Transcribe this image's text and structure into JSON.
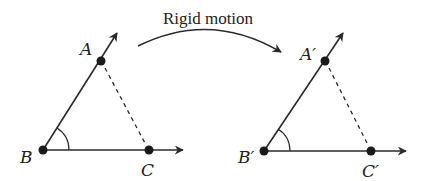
{
  "caption": "Rigid motion",
  "colors": {
    "stroke": "#2a2a2a",
    "point": "#1a1a1a",
    "background": "#ffffff"
  },
  "figures": [
    {
      "name": "original",
      "labels": {
        "A": "A",
        "B": "B",
        "C": "C"
      },
      "points": {
        "A": [
          101,
          61
        ],
        "B": [
          43,
          150
        ],
        "C": [
          149,
          150
        ]
      },
      "segment_AC": "dashed",
      "angle_marked": "ABC"
    },
    {
      "name": "image",
      "labels": {
        "A": "A′",
        "B": "B′",
        "C": "C′"
      },
      "points": {
        "A": [
          325,
          61
        ],
        "B": [
          264,
          151
        ],
        "C": [
          371,
          151
        ]
      },
      "segment_AC": "dashed",
      "angle_marked": "A′B′C′"
    }
  ]
}
